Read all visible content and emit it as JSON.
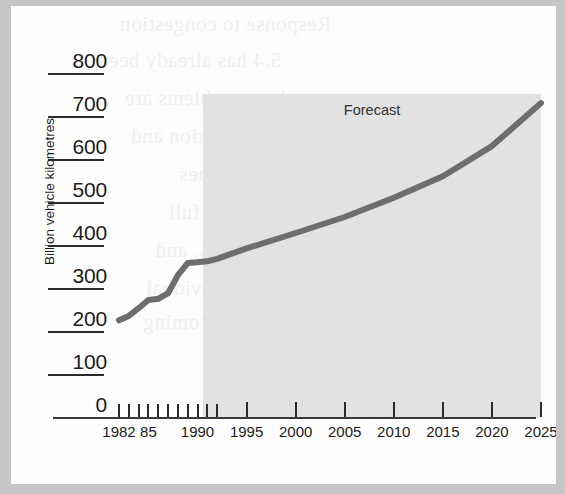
{
  "page": {
    "background_color": "#c6c6c6",
    "paper_color": "#fdfdfd",
    "showthrough_lines": [
      "Response to congestion",
      "5.4 has already been",
      "where problems are",
      "con- gestion and",
      "to the schemes",
      "after a full",
      "other areas, and",
      "for individual",
      "overcoming"
    ]
  },
  "chart_data": {
    "type": "line",
    "title": "",
    "subtitle": "",
    "xlabel": "",
    "ylabel": "Billion vehicle kilometres",
    "ylim": [
      0,
      800
    ],
    "xlim": [
      1982,
      2025
    ],
    "grid": false,
    "legend": "none",
    "y_ticks": [
      800,
      700,
      600,
      500,
      400,
      300,
      200,
      100,
      0
    ],
    "y_tick_labels": [
      "800",
      "700",
      "600",
      "500",
      "400",
      "300",
      "200",
      "100",
      "0"
    ],
    "x_tick_labels": [
      "1982",
      "85",
      "1990",
      "1995",
      "2000",
      "2005",
      "2010",
      "2015",
      "2020",
      "2025"
    ],
    "x_labelled_years": [
      1982,
      1985,
      1990,
      1995,
      2000,
      2005,
      2010,
      2015,
      2020,
      2025
    ],
    "x_minor_years": [
      1982,
      1983,
      1984,
      1985,
      1986,
      1987,
      1988,
      1989,
      1990,
      1991,
      1992
    ],
    "annotations": [
      {
        "text": "Forecast",
        "start_year": 1992,
        "end_year": 2025,
        "shaded": true,
        "shade_color": "#e2e2e2"
      }
    ],
    "series": [
      {
        "name": "Road traffic",
        "color": "#6e6e6e",
        "line_width": 6,
        "x": [
          1982,
          1983,
          1984,
          1985,
          1986,
          1987,
          1988,
          1989,
          1990,
          1991,
          1992,
          1995,
          2000,
          2005,
          2010,
          2015,
          2020,
          2025
        ],
        "values": [
          225,
          235,
          253,
          272,
          275,
          288,
          330,
          358,
          360,
          362,
          368,
          392,
          428,
          465,
          510,
          560,
          630,
          730
        ]
      }
    ]
  },
  "axis_title": {
    "y": "Billion vehicle kilometres"
  },
  "forecast": {
    "label": "Forecast"
  }
}
